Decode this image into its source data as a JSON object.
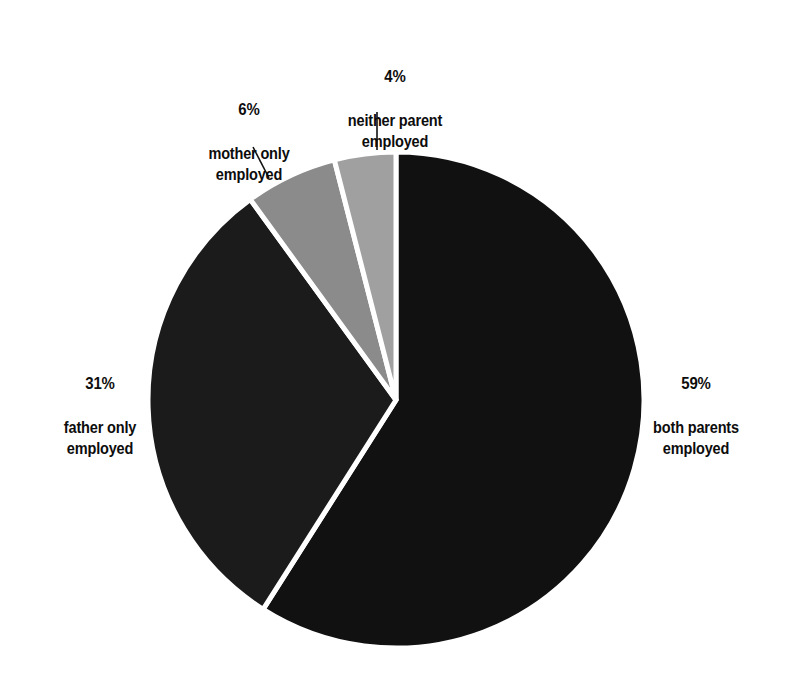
{
  "chart_data": {
    "type": "pie",
    "title": "",
    "subtitle": "",
    "xlabel": "",
    "ylabel": "",
    "units": "percent",
    "legend_position": "none",
    "grid": false,
    "start_angle_deg": 0,
    "direction": "clockwise",
    "center": {
      "x": 396,
      "y": 400
    },
    "radius": 248,
    "separator_color": "#ffffff",
    "separator_width_px": 5,
    "background_color": "#ffffff",
    "categories": [
      "both parents employed",
      "father only employed",
      "mother only employed",
      "neither parent employed"
    ],
    "values": [
      59,
      31,
      6,
      4
    ],
    "slices": [
      {
        "id": "both-parents",
        "percent_label": "59%",
        "description": "both parents\nemployed",
        "value": 59,
        "color": "#111111",
        "start_deg": 0,
        "end_deg": 212.4,
        "label_side": "right",
        "leader_line": false
      },
      {
        "id": "father-only",
        "percent_label": "31%",
        "description": "father only\nemployed",
        "value": 31,
        "color": "#1b1b1b",
        "start_deg": 212.4,
        "end_deg": 324.0,
        "label_side": "left",
        "leader_line": false
      },
      {
        "id": "mother-only",
        "percent_label": "6%",
        "description": "mother only\nemployed",
        "value": 6,
        "color": "#8b8b8b",
        "start_deg": 324.0,
        "end_deg": 345.6,
        "label_side": "top-left",
        "leader_line": true
      },
      {
        "id": "neither-parent",
        "percent_label": "4%",
        "description": "neither parent\nemployed",
        "value": 4,
        "color": "#a0a0a0",
        "start_deg": 345.6,
        "end_deg": 360.0,
        "label_side": "top",
        "leader_line": true
      }
    ],
    "leader_lines": [
      {
        "id": "mother-only-leader",
        "x1": 253,
        "y1": 147,
        "x2": 269,
        "y2": 178,
        "color": "#111111",
        "width": 1.6
      },
      {
        "id": "neither-parent-leader",
        "x1": 377,
        "y1": 112,
        "x2": 377,
        "y2": 150,
        "color": "#111111",
        "width": 1.6
      }
    ]
  },
  "labels": {
    "neither": {
      "pct": "4%",
      "desc": "neither parent\nemployed"
    },
    "mother": {
      "pct": "6%",
      "desc": "mother only\nemployed"
    },
    "father": {
      "pct": "31%",
      "desc": "father only\nemployed"
    },
    "both": {
      "pct": "59%",
      "desc": "both parents\nemployed"
    }
  }
}
